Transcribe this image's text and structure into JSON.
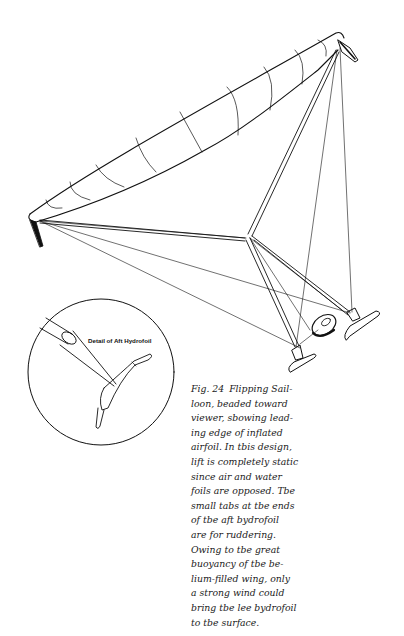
{
  "figure": {
    "inset_label": "Detail of Aft Hydrofoil",
    "line_color": "#111111",
    "background": "#ffffff"
  },
  "caption": {
    "figure_number": "Fig. 24",
    "lines": [
      "Flipping Sail-",
      "loon, beaded toward",
      "viewer, sbowing lead-",
      "ing edge of inflated",
      "airfoil. In tbis design,",
      "lift is completely static",
      "since air and water",
      "foils are opposed. Tbe",
      "small tabs at tbe ends",
      "of tbe aft bydrofoil",
      "are for ruddering.",
      "Owing to tbe great",
      "buoyancy of tbe be-",
      "lium-filled wing, only",
      "a strong wind could",
      "bring tbe lee bydrofoil",
      "to tbe surface."
    ]
  }
}
